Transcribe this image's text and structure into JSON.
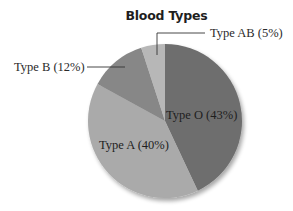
{
  "chart_data": {
    "type": "pie",
    "title": "Blood Types",
    "categories": [
      "Type O",
      "Type A",
      "Type B",
      "Type AB"
    ],
    "values": [
      43,
      40,
      12,
      5
    ],
    "unit": "%",
    "labels": [
      "Type O (43%)",
      "Type A (40%)",
      "Type B (12%)",
      "Type AB (5%)"
    ],
    "colors": [
      "#6e6e6e",
      "#aaaaaa",
      "#878787",
      "#b7b7b7"
    ],
    "start_angle_deg": 0,
    "direction": "clockwise",
    "legend": "none",
    "label_placement": {
      "Type O": "inside",
      "Type A": "inside",
      "Type B": "outside-left-with-leader",
      "Type AB": "outside-top-right-with-leader"
    }
  },
  "chart": {
    "title": "Blood Types",
    "slices": [
      {
        "name": "Type O",
        "label": "Type O (43%)",
        "value": 43,
        "color": "#6e6e6e"
      },
      {
        "name": "Type A",
        "label": "Type A (40%)",
        "value": 40,
        "color": "#aaaaaa"
      },
      {
        "name": "Type B",
        "label": "Type B (12%)",
        "value": 12,
        "color": "#878787"
      },
      {
        "name": "Type AB",
        "label": "Type AB (5%)",
        "value": 5,
        "color": "#b7b7b7"
      }
    ]
  }
}
